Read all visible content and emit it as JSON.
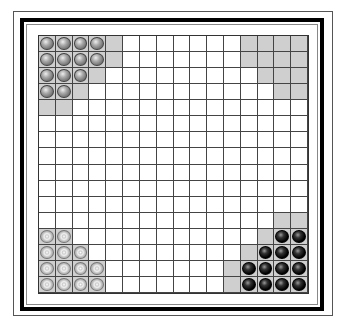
{
  "game": {
    "name": "Halma",
    "board_size": 16,
    "colors": {
      "shade": "#cfcfcf",
      "grid": "#444444",
      "gray_piece": "#777777",
      "silver_piece": "#cccccc",
      "black_piece": "#000000"
    },
    "shaded_cells": [
      [
        0,
        0
      ],
      [
        0,
        1
      ],
      [
        0,
        2
      ],
      [
        0,
        3
      ],
      [
        0,
        4
      ],
      [
        1,
        0
      ],
      [
        1,
        1
      ],
      [
        1,
        2
      ],
      [
        1,
        3
      ],
      [
        1,
        4
      ],
      [
        2,
        0
      ],
      [
        2,
        1
      ],
      [
        2,
        2
      ],
      [
        2,
        3
      ],
      [
        3,
        0
      ],
      [
        3,
        1
      ],
      [
        3,
        2
      ],
      [
        4,
        0
      ],
      [
        4,
        1
      ],
      [
        0,
        12
      ],
      [
        0,
        13
      ],
      [
        0,
        14
      ],
      [
        0,
        15
      ],
      [
        1,
        12
      ],
      [
        1,
        13
      ],
      [
        1,
        14
      ],
      [
        1,
        15
      ],
      [
        2,
        13
      ],
      [
        2,
        14
      ],
      [
        2,
        15
      ],
      [
        3,
        14
      ],
      [
        3,
        15
      ],
      [
        12,
        0
      ],
      [
        12,
        1
      ],
      [
        13,
        0
      ],
      [
        13,
        1
      ],
      [
        13,
        2
      ],
      [
        14,
        0
      ],
      [
        14,
        1
      ],
      [
        14,
        2
      ],
      [
        14,
        3
      ],
      [
        15,
        0
      ],
      [
        15,
        1
      ],
      [
        15,
        2
      ],
      [
        15,
        3
      ],
      [
        11,
        14
      ],
      [
        11,
        15
      ],
      [
        12,
        13
      ],
      [
        12,
        14
      ],
      [
        12,
        15
      ],
      [
        13,
        12
      ],
      [
        13,
        13
      ],
      [
        13,
        14
      ],
      [
        13,
        15
      ],
      [
        14,
        11
      ],
      [
        14,
        12
      ],
      [
        14,
        13
      ],
      [
        14,
        14
      ],
      [
        14,
        15
      ],
      [
        15,
        11
      ],
      [
        15,
        12
      ],
      [
        15,
        13
      ],
      [
        15,
        14
      ],
      [
        15,
        15
      ]
    ],
    "pieces": [
      {
        "player": "gray",
        "cells": [
          [
            0,
            0
          ],
          [
            0,
            1
          ],
          [
            0,
            2
          ],
          [
            0,
            3
          ],
          [
            1,
            0
          ],
          [
            1,
            1
          ],
          [
            1,
            2
          ],
          [
            1,
            3
          ],
          [
            2,
            0
          ],
          [
            2,
            1
          ],
          [
            2,
            2
          ],
          [
            3,
            0
          ],
          [
            3,
            1
          ]
        ]
      },
      {
        "player": "silver",
        "cells": [
          [
            12,
            0
          ],
          [
            12,
            1
          ],
          [
            13,
            0
          ],
          [
            13,
            1
          ],
          [
            13,
            2
          ],
          [
            14,
            0
          ],
          [
            14,
            1
          ],
          [
            14,
            2
          ],
          [
            14,
            3
          ],
          [
            15,
            0
          ],
          [
            15,
            1
          ],
          [
            15,
            2
          ],
          [
            15,
            3
          ]
        ]
      },
      {
        "player": "black",
        "cells": [
          [
            12,
            14
          ],
          [
            12,
            15
          ],
          [
            13,
            13
          ],
          [
            13,
            14
          ],
          [
            13,
            15
          ],
          [
            14,
            12
          ],
          [
            14,
            13
          ],
          [
            14,
            14
          ],
          [
            14,
            15
          ],
          [
            15,
            12
          ],
          [
            15,
            13
          ],
          [
            15,
            14
          ],
          [
            15,
            15
          ]
        ]
      }
    ]
  }
}
